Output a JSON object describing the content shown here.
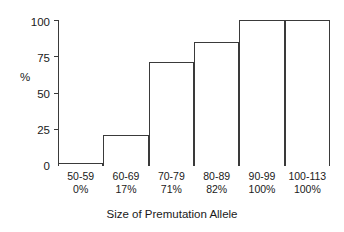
{
  "chart_data": {
    "type": "bar",
    "title": "",
    "xlabel": "Size of Premutation Allele",
    "ylabel": "%",
    "categories": [
      "50-59",
      "60-69",
      "70-79",
      "80-89",
      "90-99",
      "100-113"
    ],
    "category_percent_labels": [
      "0%",
      "17%",
      "71%",
      "82%",
      "100%",
      "100%"
    ],
    "values": [
      2,
      21,
      71,
      85,
      100,
      100
    ],
    "ylim": [
      0,
      100
    ],
    "yticks": [
      0,
      25,
      50,
      75,
      100
    ],
    "ytick_labels": [
      "0",
      "25",
      "50",
      "75",
      "100"
    ],
    "grid": false,
    "legend": false,
    "bar_fill_color": "#ffffff",
    "bar_border_color": "#3a3a3a",
    "axis_color": "#3a3a3a",
    "background_color": "#ffffff"
  },
  "axes": {
    "y_title": "%",
    "x_title": "Size of Premutation Allele"
  }
}
